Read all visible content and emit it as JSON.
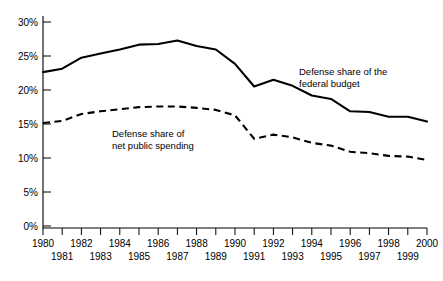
{
  "chart_data": {
    "type": "line",
    "title": "",
    "subtitle": "",
    "xlabel": "",
    "ylabel": "",
    "xlim": [
      1980,
      2000
    ],
    "ylim": [
      0,
      30
    ],
    "grid": false,
    "legend_position": "inline-annotations",
    "x": [
      1980,
      1981,
      1982,
      1983,
      1984,
      1985,
      1986,
      1987,
      1988,
      1989,
      1990,
      1991,
      1992,
      1993,
      1994,
      1995,
      1996,
      1997,
      1998,
      1999,
      2000
    ],
    "y_tick_labels": [
      "0%",
      "5%",
      "10%",
      "15%",
      "20%",
      "25%",
      "30%"
    ],
    "y_tick_values": [
      0,
      5,
      10,
      15,
      20,
      25,
      30
    ],
    "x_tick_labels_upper": [
      "1980",
      "1982",
      "1984",
      "1986",
      "1988",
      "1990",
      "1992",
      "1994",
      "1996",
      "1998",
      "2000"
    ],
    "x_tick_labels_lower": [
      "1981",
      "1983",
      "1985",
      "1987",
      "1989",
      "1991",
      "1993",
      "1995",
      "1997",
      "1999"
    ],
    "series": [
      {
        "name": "Defense share of the federal budget",
        "style": "solid",
        "color": "#000000",
        "values": [
          22.7,
          23.2,
          24.8,
          25.4,
          26.0,
          26.7,
          26.8,
          27.3,
          26.5,
          26.0,
          23.9,
          20.6,
          21.6,
          20.7,
          19.3,
          18.8,
          17.0,
          16.9,
          16.2,
          16.2,
          15.5
        ]
      },
      {
        "name": "Defense share of net public spending",
        "style": "dashed",
        "color": "#000000",
        "values": [
          15.3,
          15.6,
          16.6,
          17.0,
          17.3,
          17.6,
          17.7,
          17.7,
          17.5,
          17.2,
          16.4,
          13.0,
          13.6,
          13.2,
          12.4,
          12.0,
          11.1,
          10.9,
          10.5,
          10.4,
          9.9
        ]
      }
    ],
    "annotations": [
      {
        "id": "federal-budget-label",
        "lines": [
          "Defense share of the",
          "federal budget"
        ],
        "series": "Defense share of the federal budget"
      },
      {
        "id": "net-public-spending-label",
        "lines": [
          "Defense share of",
          "net public spending"
        ],
        "series": "Defense share of net public spending"
      }
    ]
  }
}
